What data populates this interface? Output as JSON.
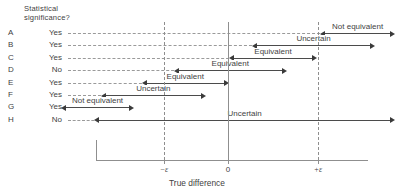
{
  "header": {
    "column_title_line1": "Statistical",
    "column_title_line2": "significance?"
  },
  "axis": {
    "title": "True difference",
    "ticks": [
      {
        "label": "−ε",
        "x": 164
      },
      {
        "label": "0",
        "x": 228
      },
      {
        "label": "+ε",
        "x": 318
      }
    ]
  },
  "rows": [
    {
      "id": "A",
      "significance": "Yes",
      "conclusion": "Not equivalent"
    },
    {
      "id": "B",
      "significance": "Yes",
      "conclusion": "Uncertain"
    },
    {
      "id": "C",
      "significance": "Yes",
      "conclusion": "Equivalent"
    },
    {
      "id": "D",
      "significance": "No",
      "conclusion": "Equivalent"
    },
    {
      "id": "E",
      "significance": "Yes",
      "conclusion": "Equivalent"
    },
    {
      "id": "F",
      "significance": "Yes",
      "conclusion": "Uncertain"
    },
    {
      "id": "G",
      "significance": "Yes",
      "conclusion": "Not equivalent"
    },
    {
      "id": "H",
      "significance": "No",
      "conclusion": "Uncertain"
    }
  ],
  "chart_data": {
    "type": "bar",
    "title": "",
    "xlabel": "True difference",
    "ylabel": "",
    "categories": [
      "A",
      "B",
      "C",
      "D",
      "E",
      "F",
      "G",
      "H"
    ],
    "xlim": [
      -1.55,
      1.55
    ],
    "grid": true,
    "legend": "none",
    "reference_lines": [
      {
        "label": "−ε",
        "value": -1.0,
        "style": "dashed"
      },
      {
        "label": "0",
        "value": 0.0,
        "style": "solid"
      },
      {
        "label": "+ε",
        "value": 1.0,
        "style": "dashed"
      }
    ],
    "series": [
      {
        "name": "confidence interval",
        "intervals": [
          {
            "category": "A",
            "low": 1.08,
            "high": 1.8,
            "label": "Not equivalent",
            "significance": "Yes"
          },
          {
            "category": "B",
            "low": 0.32,
            "high": 1.58,
            "label": "Uncertain",
            "significance": "Yes"
          },
          {
            "category": "C",
            "low": 0.07,
            "high": 0.93,
            "label": "Equivalent",
            "significance": "Yes"
          },
          {
            "category": "D",
            "low": -0.55,
            "high": 0.6,
            "label": "Equivalent",
            "significance": "No"
          },
          {
            "category": "E",
            "low": -0.9,
            "high": -0.05,
            "label": "Equivalent",
            "significance": "Yes"
          },
          {
            "category": "F",
            "low": -1.36,
            "high": -0.3,
            "label": "Uncertain",
            "significance": "Yes"
          },
          {
            "category": "G",
            "low": -1.8,
            "high": -1.1,
            "label": "Not equivalent",
            "significance": "Yes"
          },
          {
            "category": "H",
            "low": -1.43,
            "high": 1.8,
            "label": "Uncertain",
            "significance": "No"
          }
        ]
      }
    ]
  }
}
